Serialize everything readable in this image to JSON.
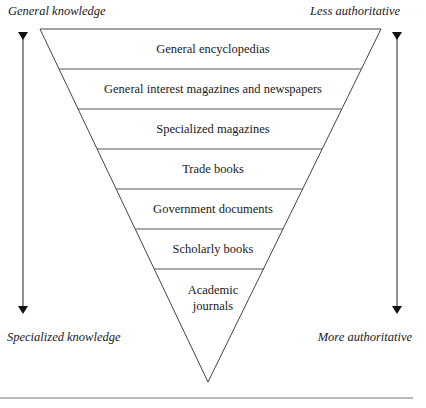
{
  "diagram": {
    "type": "inverted-pyramid",
    "axis_left": {
      "top_label": "General knowledge",
      "bottom_label": "Specialized knowledge"
    },
    "axis_right": {
      "top_label": "Less authoritative",
      "bottom_label": "More authoritative"
    },
    "tiers": [
      {
        "label": "General encyclopedias"
      },
      {
        "label": "General interest magazines and newspapers"
      },
      {
        "label": "Specialized magazines"
      },
      {
        "label": "Trade books"
      },
      {
        "label": "Government documents"
      },
      {
        "label": "Scholarly books"
      },
      {
        "label_line1": "Academic",
        "label_line2": "journals"
      }
    ],
    "colors": {
      "line": "#444444",
      "text": "#1a1a1a",
      "background": "#ffffff"
    }
  }
}
